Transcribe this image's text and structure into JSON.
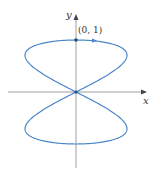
{
  "diagram": {
    "axes": {
      "x_label": "x",
      "y_label": "y"
    },
    "point_label": "(0, 1)",
    "curve": {
      "description": "parametric figure-eight curve x = sin 2t, y = cos t",
      "color": "#4a86c8"
    },
    "axis_color": "#777777"
  }
}
